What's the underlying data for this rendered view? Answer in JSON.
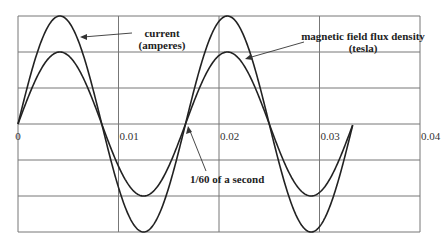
{
  "chart_data": {
    "type": "line",
    "title": "",
    "xlabel": "",
    "ylabel": "",
    "xlim": [
      0,
      0.04
    ],
    "ylim": [
      -3,
      3
    ],
    "grid": true,
    "x_ticks": [
      "0",
      "0.01",
      "0.02",
      "0.03",
      "0.04"
    ],
    "y_ticks": [],
    "frequency_hz": 60,
    "x_end": 0.0333,
    "series": [
      {
        "name": "current (amperes)",
        "function": "sine",
        "amplitude": 3,
        "period": 0.016667
      },
      {
        "name": "magnetic field flux density (tesla)",
        "function": "sine",
        "amplitude": 2,
        "period": 0.016667
      }
    ],
    "annotations": [
      {
        "text_lines": [
          "current",
          "(amperes)"
        ],
        "points_to": "current"
      },
      {
        "text_lines": [
          "magnetic field flux density",
          "(tesla)"
        ],
        "points_to": "magnetic field flux density"
      },
      {
        "text_lines": [
          "1/60 of a second"
        ],
        "points_to_x": 0.016667
      }
    ]
  }
}
